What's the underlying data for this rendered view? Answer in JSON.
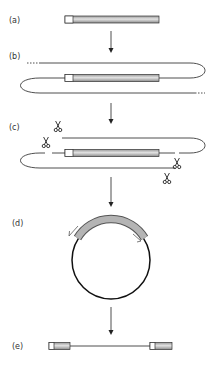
{
  "figure": {
    "panels": [
      {
        "id": "a",
        "label": "(a)",
        "description": "linear DNA fragment with shaded insert"
      },
      {
        "id": "b",
        "label": "(b)",
        "description": "fragment within longer DNA strand"
      },
      {
        "id": "c",
        "label": "(c)",
        "description": "cleavage sites marked by scissors"
      },
      {
        "id": "d",
        "label": "(d)",
        "description": "circularized molecule with arrows"
      },
      {
        "id": "e",
        "label": "(e)",
        "description": "inverse product with flanking segments"
      }
    ],
    "icons": {
      "scissors": "scissors-icon",
      "arrow": "arrow-down-icon"
    },
    "colors": {
      "line": "#222222",
      "bar_fill": "#b8b8b8",
      "bar_stripe": "#e0e0e0",
      "arc_fill": "#a8a8a8"
    }
  }
}
